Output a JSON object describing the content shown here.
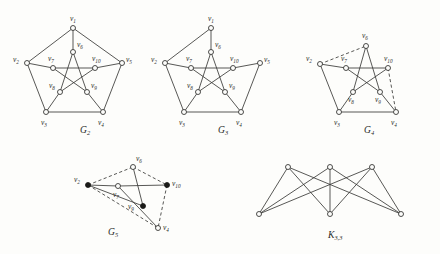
{
  "figure": {
    "background_color": "#fdfdfb",
    "edge_color": "#3a3a38",
    "node_fill_open": "#fdfdfb",
    "node_fill_solid": "#1a1a18",
    "label_color": "#2a2a28"
  },
  "graphs": [
    {
      "id": "G2",
      "caption": "G",
      "caption_sub": "2",
      "caption_x": 80,
      "caption_y": 133,
      "description": "Petersen-like graph on ten vertices drawn as outer pentagon with inner pentagram",
      "nodes": [
        {
          "name": "v1",
          "label": "v",
          "sub": "1",
          "x": 73,
          "y": 28,
          "style": "open",
          "lx": 70,
          "ly": 21
        },
        {
          "name": "v2",
          "label": "v",
          "sub": "2",
          "x": 27,
          "y": 63,
          "style": "open",
          "lx": 13,
          "ly": 62
        },
        {
          "name": "v3",
          "label": "v",
          "sub": "3",
          "x": 46,
          "y": 112,
          "style": "open",
          "lx": 41,
          "ly": 125
        },
        {
          "name": "v4",
          "label": "v",
          "sub": "4",
          "x": 103,
          "y": 112,
          "style": "open",
          "lx": 98,
          "ly": 125
        },
        {
          "name": "v5",
          "label": "v",
          "sub": "5",
          "x": 122,
          "y": 63,
          "style": "open",
          "lx": 126,
          "ly": 62
        },
        {
          "name": "v6",
          "label": "v",
          "sub": "6",
          "x": 73,
          "y": 52,
          "style": "open",
          "lx": 77,
          "ly": 47
        },
        {
          "name": "v7",
          "label": "v",
          "sub": "7",
          "x": 53,
          "y": 68,
          "style": "open",
          "lx": 48,
          "ly": 61
        },
        {
          "name": "v8",
          "label": "v",
          "sub": "8",
          "x": 60,
          "y": 92,
          "style": "open",
          "lx": 49,
          "ly": 88
        },
        {
          "name": "v9",
          "label": "v",
          "sub": "9",
          "x": 87,
          "y": 92,
          "style": "open",
          "lx": 91,
          "ly": 88
        },
        {
          "name": "v10",
          "label": "v",
          "sub": "10",
          "x": 95,
          "y": 68,
          "style": "open",
          "lx": 92,
          "ly": 61
        }
      ],
      "edges": [
        {
          "a": "v1",
          "b": "v2",
          "style": "solid"
        },
        {
          "a": "v1",
          "b": "v5",
          "style": "solid"
        },
        {
          "a": "v2",
          "b": "v3",
          "style": "solid"
        },
        {
          "a": "v3",
          "b": "v4",
          "style": "solid"
        },
        {
          "a": "v4",
          "b": "v5",
          "style": "solid"
        },
        {
          "a": "v1",
          "b": "v6",
          "style": "solid"
        },
        {
          "a": "v2",
          "b": "v7",
          "style": "solid"
        },
        {
          "a": "v3",
          "b": "v8",
          "style": "solid"
        },
        {
          "a": "v4",
          "b": "v9",
          "style": "solid"
        },
        {
          "a": "v5",
          "b": "v10",
          "style": "solid"
        },
        {
          "a": "v6",
          "b": "v8",
          "style": "solid"
        },
        {
          "a": "v8",
          "b": "v10",
          "style": "solid"
        },
        {
          "a": "v10",
          "b": "v7",
          "style": "solid"
        },
        {
          "a": "v7",
          "b": "v9",
          "style": "solid"
        },
        {
          "a": "v9",
          "b": "v6",
          "style": "solid"
        }
      ]
    },
    {
      "id": "G3",
      "caption": "G",
      "caption_sub": "3",
      "caption_x": 218,
      "caption_y": 133,
      "description": "Same drawing as G2 but with edge v1-v5 removed",
      "nodes": [
        {
          "name": "v1",
          "label": "v",
          "sub": "1",
          "x": 211,
          "y": 28,
          "style": "open",
          "lx": 208,
          "ly": 21
        },
        {
          "name": "v2",
          "label": "v",
          "sub": "2",
          "x": 165,
          "y": 63,
          "style": "open",
          "lx": 151,
          "ly": 62
        },
        {
          "name": "v3",
          "label": "v",
          "sub": "3",
          "x": 184,
          "y": 112,
          "style": "open",
          "lx": 179,
          "ly": 125
        },
        {
          "name": "v4",
          "label": "v",
          "sub": "4",
          "x": 241,
          "y": 112,
          "style": "open",
          "lx": 236,
          "ly": 125
        },
        {
          "name": "v5",
          "label": "v",
          "sub": "5",
          "x": 260,
          "y": 63,
          "style": "open",
          "lx": 264,
          "ly": 62
        },
        {
          "name": "v6",
          "label": "v",
          "sub": "6",
          "x": 211,
          "y": 52,
          "style": "open",
          "lx": 215,
          "ly": 47
        },
        {
          "name": "v7",
          "label": "v",
          "sub": "7",
          "x": 191,
          "y": 68,
          "style": "open",
          "lx": 186,
          "ly": 61
        },
        {
          "name": "v8",
          "label": "v",
          "sub": "8",
          "x": 198,
          "y": 92,
          "style": "open",
          "lx": 187,
          "ly": 88
        },
        {
          "name": "v9",
          "label": "v",
          "sub": "9",
          "x": 225,
          "y": 92,
          "style": "open",
          "lx": 229,
          "ly": 88
        },
        {
          "name": "v10",
          "label": "v",
          "sub": "10",
          "x": 233,
          "y": 68,
          "style": "open",
          "lx": 230,
          "ly": 61
        }
      ],
      "edges": [
        {
          "a": "v1",
          "b": "v2",
          "style": "solid"
        },
        {
          "a": "v2",
          "b": "v3",
          "style": "solid"
        },
        {
          "a": "v3",
          "b": "v4",
          "style": "solid"
        },
        {
          "a": "v4",
          "b": "v5",
          "style": "solid"
        },
        {
          "a": "v1",
          "b": "v6",
          "style": "solid"
        },
        {
          "a": "v2",
          "b": "v7",
          "style": "solid"
        },
        {
          "a": "v3",
          "b": "v8",
          "style": "solid"
        },
        {
          "a": "v4",
          "b": "v9",
          "style": "solid"
        },
        {
          "a": "v5",
          "b": "v10",
          "style": "solid"
        },
        {
          "a": "v6",
          "b": "v8",
          "style": "solid"
        },
        {
          "a": "v8",
          "b": "v10",
          "style": "solid"
        },
        {
          "a": "v10",
          "b": "v7",
          "style": "solid"
        },
        {
          "a": "v7",
          "b": "v9",
          "style": "solid"
        },
        {
          "a": "v9",
          "b": "v6",
          "style": "solid"
        }
      ]
    },
    {
      "id": "G4",
      "caption": "G",
      "caption_sub": "4",
      "caption_x": 364,
      "caption_y": 133,
      "description": "Reduced graph with vertices v1 and v5 suppressed; dashed edges v2-v6 and v10-v4",
      "nodes": [
        {
          "name": "v2",
          "label": "v",
          "sub": "2",
          "x": 320,
          "y": 64,
          "style": "open",
          "lx": 306,
          "ly": 61
        },
        {
          "name": "v3",
          "label": "v",
          "sub": "3",
          "x": 339,
          "y": 112,
          "style": "open",
          "lx": 334,
          "ly": 125
        },
        {
          "name": "v4",
          "label": "v",
          "sub": "4",
          "x": 396,
          "y": 112,
          "style": "open",
          "lx": 391,
          "ly": 125
        },
        {
          "name": "v6",
          "label": "v",
          "sub": "6",
          "x": 366,
          "y": 46,
          "style": "open",
          "lx": 362,
          "ly": 38
        },
        {
          "name": "v7",
          "label": "v",
          "sub": "7",
          "x": 346,
          "y": 68,
          "style": "open",
          "lx": 341,
          "ly": 61
        },
        {
          "name": "v8",
          "label": "v",
          "sub": "8",
          "x": 353,
          "y": 92,
          "style": "open",
          "lx": 348,
          "ly": 102
        },
        {
          "name": "v9",
          "label": "v",
          "sub": "9",
          "x": 380,
          "y": 92,
          "style": "open",
          "lx": 375,
          "ly": 102
        },
        {
          "name": "v10",
          "label": "v",
          "sub": "10",
          "x": 388,
          "y": 68,
          "style": "open",
          "lx": 384,
          "ly": 61
        }
      ],
      "edges": [
        {
          "a": "v2",
          "b": "v3",
          "style": "solid"
        },
        {
          "a": "v3",
          "b": "v4",
          "style": "solid"
        },
        {
          "a": "v2",
          "b": "v7",
          "style": "solid"
        },
        {
          "a": "v3",
          "b": "v8",
          "style": "solid"
        },
        {
          "a": "v4",
          "b": "v9",
          "style": "solid"
        },
        {
          "a": "v6",
          "b": "v8",
          "style": "solid"
        },
        {
          "a": "v8",
          "b": "v10",
          "style": "solid"
        },
        {
          "a": "v10",
          "b": "v7",
          "style": "solid"
        },
        {
          "a": "v7",
          "b": "v9",
          "style": "solid"
        },
        {
          "a": "v9",
          "b": "v6",
          "style": "solid"
        },
        {
          "a": "v2",
          "b": "v6",
          "style": "dashed"
        },
        {
          "a": "v10",
          "b": "v4",
          "style": "dashed"
        }
      ]
    },
    {
      "id": "G5",
      "caption": "G",
      "caption_sub": "5",
      "caption_x": 108,
      "caption_y": 235,
      "description": "Six-vertex contraction with solid and dashed edges; v2, v10 and v9 are solid vertices",
      "nodes": [
        {
          "name": "v2",
          "label": "v",
          "sub": "2",
          "x": 88,
          "y": 185,
          "style": "filled",
          "lx": 74,
          "ly": 182
        },
        {
          "name": "v6",
          "label": "v",
          "sub": "6",
          "x": 133,
          "y": 167,
          "style": "open",
          "lx": 136,
          "ly": 161
        },
        {
          "name": "v10",
          "label": "v",
          "sub": "10",
          "x": 167,
          "y": 185,
          "style": "filled",
          "lx": 172,
          "ly": 186
        },
        {
          "name": "v7",
          "label": "v",
          "sub": "7",
          "x": 118,
          "y": 186,
          "style": "open",
          "lx": 113,
          "ly": 197
        },
        {
          "name": "v9",
          "label": "v",
          "sub": "9",
          "x": 143,
          "y": 206,
          "style": "filled",
          "lx": 128,
          "ly": 209
        },
        {
          "name": "v4",
          "label": "v",
          "sub": "4",
          "x": 158,
          "y": 228,
          "style": "open",
          "lx": 163,
          "ly": 230
        }
      ],
      "edges": [
        {
          "a": "v2",
          "b": "v6",
          "style": "dashed"
        },
        {
          "a": "v2",
          "b": "v7",
          "style": "solid"
        },
        {
          "a": "v7",
          "b": "v10",
          "style": "solid"
        },
        {
          "a": "v6",
          "b": "v10",
          "style": "dashed"
        },
        {
          "a": "v6",
          "b": "v9",
          "style": "solid"
        },
        {
          "a": "v2",
          "b": "v9",
          "style": "solid"
        },
        {
          "a": "v7",
          "b": "v4",
          "style": "solid"
        },
        {
          "a": "v2",
          "b": "v4",
          "style": "dashed"
        },
        {
          "a": "v10",
          "b": "v4",
          "style": "dashed"
        }
      ]
    },
    {
      "id": "K33",
      "caption": "K",
      "caption_sub": "3,3",
      "caption_x": 328,
      "caption_y": 238,
      "description": "Complete bipartite graph on three plus three vertices",
      "nodes": [
        {
          "name": "u1",
          "label": "",
          "sub": "",
          "x": 288,
          "y": 167,
          "style": "open",
          "lx": 0,
          "ly": 0
        },
        {
          "name": "u2",
          "label": "",
          "sub": "",
          "x": 330,
          "y": 167,
          "style": "open",
          "lx": 0,
          "ly": 0
        },
        {
          "name": "u3",
          "label": "",
          "sub": "",
          "x": 372,
          "y": 167,
          "style": "open",
          "lx": 0,
          "ly": 0
        },
        {
          "name": "w1",
          "label": "",
          "sub": "",
          "x": 259,
          "y": 214,
          "style": "open",
          "lx": 0,
          "ly": 0
        },
        {
          "name": "w2",
          "label": "",
          "sub": "",
          "x": 330,
          "y": 214,
          "style": "open",
          "lx": 0,
          "ly": 0
        },
        {
          "name": "w3",
          "label": "",
          "sub": "",
          "x": 401,
          "y": 214,
          "style": "open",
          "lx": 0,
          "ly": 0
        }
      ],
      "edges": [
        {
          "a": "u1",
          "b": "w1",
          "style": "solid"
        },
        {
          "a": "u1",
          "b": "w2",
          "style": "solid"
        },
        {
          "a": "u1",
          "b": "w3",
          "style": "solid"
        },
        {
          "a": "u2",
          "b": "w1",
          "style": "solid"
        },
        {
          "a": "u2",
          "b": "w2",
          "style": "solid"
        },
        {
          "a": "u2",
          "b": "w3",
          "style": "solid"
        },
        {
          "a": "u3",
          "b": "w1",
          "style": "solid"
        },
        {
          "a": "u3",
          "b": "w2",
          "style": "solid"
        },
        {
          "a": "u3",
          "b": "w3",
          "style": "solid"
        }
      ]
    }
  ]
}
